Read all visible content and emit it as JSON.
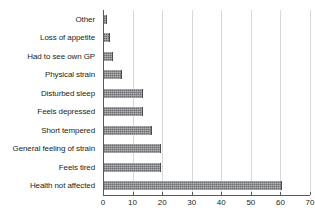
{
  "chart_data": {
    "type": "bar",
    "orientation": "horizontal",
    "title": "",
    "subtitle": "",
    "xlabel": "",
    "ylabel": "",
    "xlim": [
      0,
      70
    ],
    "xticks": [
      0,
      10,
      20,
      30,
      40,
      50,
      60,
      70
    ],
    "grid": true,
    "legend": false,
    "legend_position": "none",
    "bar_color": "#6d6e71",
    "axis_color": "#58595b",
    "grid_color": "#d9d9d9",
    "text_color": "#231f20",
    "categories": [
      "Other",
      "Loss of appetite",
      "Had to see own GP",
      "Physical strain",
      "Disturbed sleep",
      "Feels depressed",
      "Short tempered",
      "General feeling of strain",
      "Feels tired",
      "Health not affected"
    ],
    "values": [
      1.5,
      2.5,
      3.5,
      6.5,
      13.5,
      13.5,
      16.5,
      19.5,
      19.5,
      60.5
    ]
  }
}
